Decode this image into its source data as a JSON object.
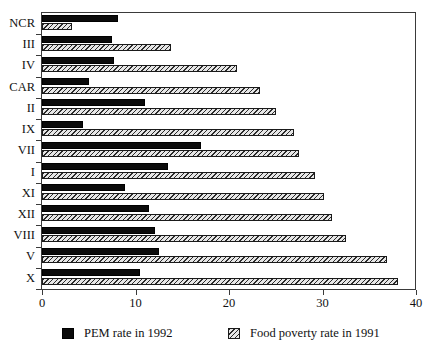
{
  "chart_data": {
    "type": "bar",
    "orientation": "horizontal",
    "title": "",
    "subtitle": "",
    "xlabel": "",
    "ylabel": "",
    "xlim": [
      0,
      40
    ],
    "xticks": [
      0,
      10,
      20,
      30,
      40
    ],
    "xtick_labels": [
      "0",
      "10",
      "20",
      "30",
      "40"
    ],
    "grid": false,
    "legend_position": "bottom",
    "categories": [
      "NCR",
      "III",
      "IV",
      "CAR",
      "II",
      "IX",
      "VII",
      "I",
      "XI",
      "XII",
      "VIII",
      "V",
      "X"
    ],
    "series": [
      {
        "name": "PEM rate in 1992",
        "color": "#0b0b0b",
        "pattern": "solid",
        "values": [
          8.1,
          7.5,
          7.7,
          5.0,
          11.0,
          4.4,
          17.0,
          13.5,
          8.9,
          11.4,
          12.1,
          12.5,
          10.5
        ]
      },
      {
        "name": "Food poverty rate in 1991",
        "color": "#dedede",
        "pattern": "diagonal-hatch",
        "values": [
          3.2,
          13.8,
          20.9,
          23.3,
          25.0,
          27.0,
          27.5,
          29.2,
          30.2,
          31.0,
          32.5,
          36.9,
          38.1
        ]
      }
    ]
  },
  "legend": {
    "items": [
      {
        "label": "PEM rate in 1992",
        "swatch": "solid-black-swatch"
      },
      {
        "label": "Food poverty rate in 1991",
        "swatch": "hatched-swatch"
      }
    ]
  }
}
